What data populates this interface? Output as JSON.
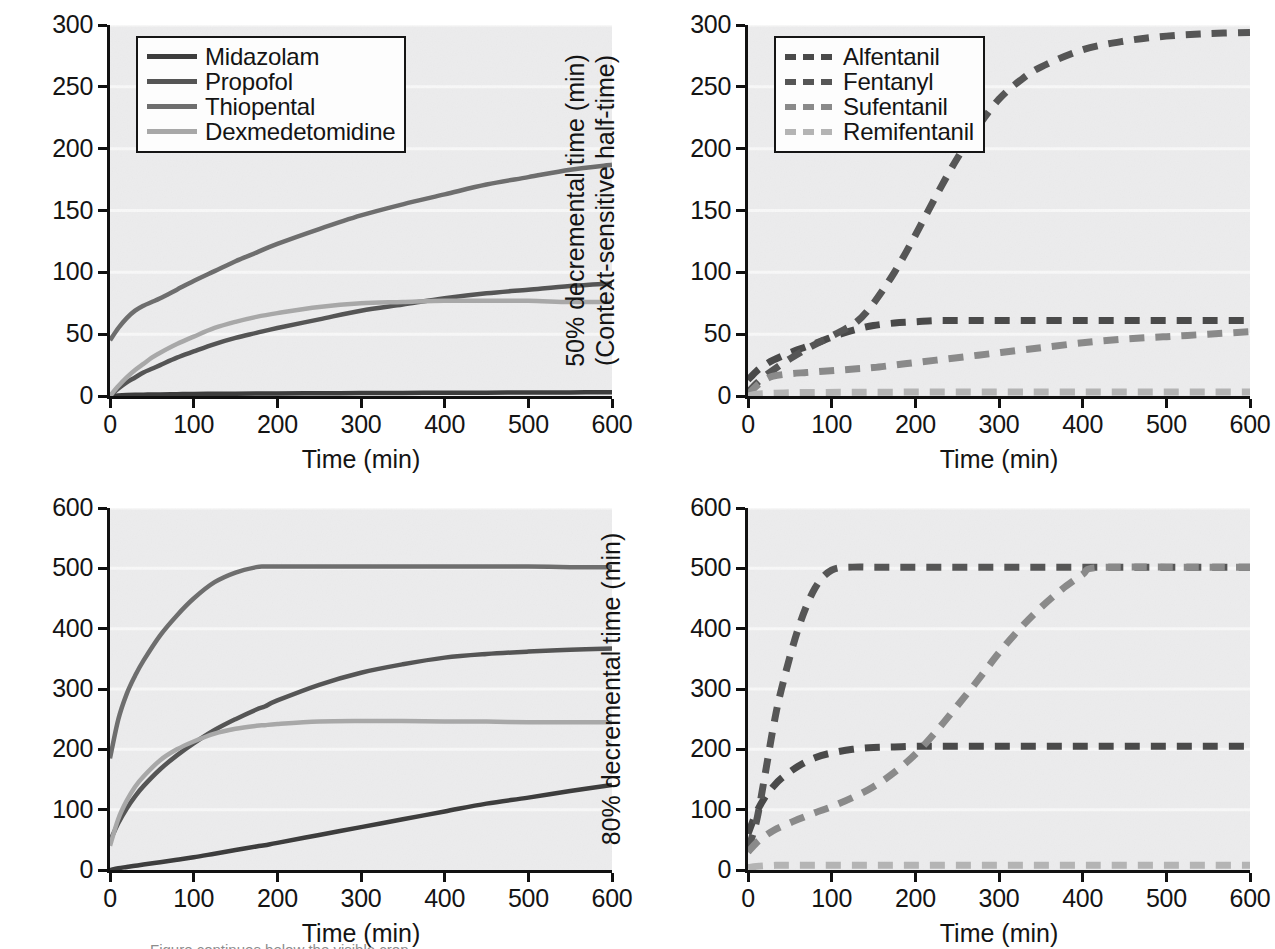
{
  "figure": {
    "background": "#ffffff",
    "plot_background": "#ececed",
    "gridline_color": "#f8f8f8",
    "axis_color": "#111111"
  },
  "colors": {
    "midazolam": "#3d3d3d",
    "propofol": "#555555",
    "thiopental": "#6e6e6e",
    "dexmedetomidine": "#a8a8a8",
    "alfentanil": "#4a4a4a",
    "fentanyl": "#565656",
    "sufentanil": "#8a8a8a",
    "remifentanil": "#b4b4b4"
  },
  "caption": {
    "clipped_text": "Figure continues below the visible crop"
  },
  "chart_data": [
    {
      "id": "top-left",
      "type": "line",
      "title": "",
      "xlabel": "Time (min)",
      "ylabel": "50% decremental time (min)",
      "ylabel_line2": "(Context-sensitive half-time)",
      "xlim": [
        0,
        600
      ],
      "ylim": [
        0,
        300
      ],
      "xticks": [
        0,
        100,
        200,
        300,
        400,
        500,
        600
      ],
      "yticks": [
        0,
        50,
        100,
        150,
        200,
        250,
        300
      ],
      "grid": "horizontal",
      "legend_position": "top-left",
      "linestyle": "solid",
      "x": [
        0,
        10,
        20,
        30,
        40,
        50,
        60,
        80,
        100,
        125,
        150,
        175,
        200,
        250,
        300,
        350,
        400,
        450,
        500,
        550,
        600
      ],
      "series": [
        {
          "name": "Midazolam",
          "color": "#3d3d3d",
          "values": [
            0,
            0.5,
            0.8,
            1.0,
            1.1,
            1.2,
            1.3,
            1.5,
            1.6,
            1.8,
            1.9,
            2.0,
            2.1,
            2.2,
            2.4,
            2.5,
            2.6,
            2.7,
            2.8,
            2.9,
            3.0
          ]
        },
        {
          "name": "Propofol",
          "color": "#555555",
          "values": [
            0,
            6,
            11,
            15,
            19,
            22,
            25,
            31,
            36,
            42,
            47,
            51,
            55,
            62,
            69,
            74,
            79,
            83,
            86,
            89,
            91
          ]
        },
        {
          "name": "Thiopental",
          "color": "#6e6e6e",
          "values": [
            45,
            55,
            63,
            69,
            73,
            76,
            79,
            86,
            93,
            101,
            109,
            116,
            123,
            135,
            146,
            155,
            163,
            171,
            177,
            183,
            187
          ]
        },
        {
          "name": "Dexmedetomidine",
          "color": "#a8a8a8",
          "values": [
            0,
            8,
            15,
            21,
            26,
            31,
            35,
            42,
            48,
            55,
            60,
            64,
            67,
            72,
            75,
            76,
            77,
            77,
            77,
            76,
            76
          ]
        }
      ]
    },
    {
      "id": "top-right",
      "type": "line",
      "title": "",
      "xlabel": "Time (min)",
      "ylabel": "50% decremental time (min)",
      "ylabel_line2": "(Context-sensitive half-time)",
      "xlim": [
        0,
        600
      ],
      "ylim": [
        0,
        300
      ],
      "xticks": [
        0,
        100,
        200,
        300,
        400,
        500,
        600
      ],
      "yticks": [
        0,
        50,
        100,
        150,
        200,
        250,
        300
      ],
      "grid": "horizontal",
      "legend_position": "top-left",
      "linestyle": "dashed",
      "x": [
        0,
        10,
        20,
        30,
        50,
        70,
        90,
        110,
        130,
        150,
        175,
        200,
        225,
        250,
        275,
        300,
        325,
        350,
        400,
        450,
        500,
        550,
        600
      ],
      "series": [
        {
          "name": "Alfentanil",
          "color": "#4a4a4a",
          "values": [
            13,
            20,
            25,
            29,
            35,
            40,
            45,
            50,
            54,
            57,
            59,
            60,
            61,
            61,
            61,
            61,
            61,
            61,
            61,
            61,
            61,
            61,
            61
          ]
        },
        {
          "name": "Fentanyl",
          "color": "#565656",
          "values": [
            3,
            10,
            16,
            21,
            30,
            38,
            45,
            52,
            60,
            75,
            100,
            130,
            162,
            192,
            218,
            240,
            255,
            266,
            280,
            287,
            291,
            293,
            294
          ]
        },
        {
          "name": "Sufentanil",
          "color": "#8a8a8a",
          "values": [
            1,
            8,
            13,
            16,
            18,
            19,
            20,
            21,
            22,
            23,
            25,
            27,
            29,
            31,
            33,
            35,
            37,
            39,
            43,
            46,
            48,
            50,
            52
          ]
        },
        {
          "name": "Remifentanil",
          "color": "#b4b4b4",
          "values": [
            0,
            1.5,
            2.0,
            2.3,
            2.6,
            2.8,
            2.9,
            3.0,
            3.0,
            3.1,
            3.1,
            3.2,
            3.2,
            3.2,
            3.2,
            3.3,
            3.3,
            3.3,
            3.3,
            3.3,
            3.3,
            3.3,
            3.3
          ]
        }
      ]
    },
    {
      "id": "bottom-left",
      "type": "line",
      "title": "",
      "xlabel": "Time (min)",
      "ylabel": "80% decremental time (min)",
      "ylabel_line2": "",
      "xlim": [
        0,
        600
      ],
      "ylim": [
        0,
        600
      ],
      "xticks": [
        0,
        100,
        200,
        300,
        400,
        500,
        600
      ],
      "yticks": [
        0,
        100,
        200,
        300,
        400,
        500,
        600
      ],
      "grid": "horizontal",
      "legend_position": "none",
      "linestyle": "solid",
      "x": [
        0,
        10,
        20,
        30,
        40,
        60,
        80,
        100,
        125,
        150,
        175,
        185,
        200,
        250,
        300,
        350,
        400,
        450,
        500,
        550,
        600
      ],
      "series": [
        {
          "name": "Midazolam",
          "color": "#3d3d3d",
          "values": [
            0,
            3,
            5,
            7,
            9,
            13,
            17,
            21,
            27,
            33,
            39,
            41,
            45,
            58,
            71,
            84,
            97,
            110,
            120,
            131,
            141
          ]
        },
        {
          "name": "Propofol",
          "color": "#555555",
          "values": [
            48,
            78,
            102,
            122,
            139,
            167,
            190,
            210,
            232,
            250,
            266,
            271,
            281,
            307,
            327,
            341,
            352,
            358,
            362,
            365,
            367
          ]
        },
        {
          "name": "Thiopental",
          "color": "#6e6e6e",
          "values": [
            185,
            250,
            292,
            322,
            347,
            389,
            422,
            450,
            477,
            493,
            502,
            503,
            503,
            503,
            503,
            503,
            503,
            503,
            503,
            502,
            502
          ]
        },
        {
          "name": "Dexmedetomidine",
          "color": "#a8a8a8",
          "values": [
            40,
            85,
            115,
            138,
            155,
            182,
            200,
            213,
            226,
            234,
            239,
            240,
            242,
            246,
            247,
            247,
            246,
            246,
            245,
            245,
            245
          ]
        }
      ]
    },
    {
      "id": "bottom-right",
      "type": "line",
      "title": "",
      "xlabel": "Time (min)",
      "ylabel": "80% decremental time (min)",
      "ylabel_line2": "",
      "xlim": [
        0,
        600
      ],
      "ylim": [
        0,
        600
      ],
      "xticks": [
        0,
        100,
        200,
        300,
        400,
        500,
        600
      ],
      "yticks": [
        0,
        100,
        200,
        300,
        400,
        500,
        600
      ],
      "grid": "horizontal",
      "legend_position": "none",
      "linestyle": "dashed",
      "x": [
        0,
        10,
        20,
        30,
        40,
        60,
        80,
        100,
        125,
        150,
        175,
        200,
        225,
        250,
        275,
        300,
        325,
        350,
        375,
        400,
        410,
        450,
        500,
        550,
        600
      ],
      "series": [
        {
          "name": "Alfentanil",
          "color": "#4a4a4a",
          "values": [
            60,
            95,
            120,
            138,
            152,
            172,
            186,
            194,
            200,
            203,
            204,
            205,
            205,
            205,
            205,
            205,
            205,
            205,
            205,
            205,
            205,
            205,
            205,
            205,
            205
          ]
        },
        {
          "name": "Fentanyl",
          "color": "#565656",
          "values": [
            35,
            80,
            155,
            235,
            300,
            400,
            467,
            497,
            502,
            502,
            502,
            502,
            502,
            502,
            502,
            502,
            502,
            502,
            502,
            502,
            502,
            502,
            502,
            502,
            502
          ]
        },
        {
          "name": "Sufentanil",
          "color": "#8a8a8a",
          "values": [
            30,
            45,
            56,
            65,
            72,
            84,
            95,
            105,
            120,
            138,
            162,
            192,
            230,
            272,
            315,
            360,
            400,
            435,
            465,
            490,
            500,
            502,
            502,
            502,
            502
          ]
        },
        {
          "name": "Remifentanil",
          "color": "#b4b4b4",
          "values": [
            4,
            6,
            7,
            7.5,
            8,
            8,
            8,
            8,
            8,
            8,
            8,
            8,
            8,
            8,
            8,
            8,
            8,
            8,
            8,
            8,
            8,
            8,
            8,
            8,
            8
          ]
        }
      ]
    }
  ]
}
